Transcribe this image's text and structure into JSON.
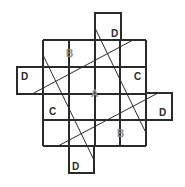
{
  "diagram": {
    "stroke_color": "#2a2a2a",
    "label_colors": {
      "dark": "#2a2a2a",
      "light": "#8a8a8a"
    },
    "grid": {
      "x_lines": [
        43,
        69,
        95,
        120,
        146
      ],
      "y_lines": [
        40,
        67,
        94,
        120,
        146
      ]
    },
    "extensions": [
      {
        "name": "top",
        "x": 95,
        "y": 13,
        "w": 26,
        "h": 27
      },
      {
        "name": "left",
        "x": 17,
        "y": 67,
        "w": 26,
        "h": 27
      },
      {
        "name": "right",
        "x": 146,
        "y": 93,
        "w": 26,
        "h": 27
      },
      {
        "name": "bottom",
        "x": 69,
        "y": 146,
        "w": 25,
        "h": 27
      }
    ],
    "diagonals": [
      {
        "name": "upper-shallow",
        "x1": 32,
        "y1": 94,
        "x2": 133,
        "y2": 40
      },
      {
        "name": "lower-shallow",
        "x1": 58,
        "y1": 146,
        "x2": 158,
        "y2": 93
      },
      {
        "name": "left-steep",
        "x1": 43,
        "y1": 55,
        "x2": 94,
        "y2": 160
      },
      {
        "name": "right-steep",
        "x1": 95,
        "y1": 28,
        "x2": 145,
        "y2": 131
      }
    ],
    "labels": [
      {
        "text": "D",
        "x": 111,
        "y": 37,
        "tone": "dark"
      },
      {
        "text": "B",
        "x": 66,
        "y": 57,
        "tone": "light"
      },
      {
        "text": "D",
        "x": 21,
        "y": 80,
        "tone": "dark"
      },
      {
        "text": "C",
        "x": 134,
        "y": 80,
        "tone": "dark"
      },
      {
        "text": "A",
        "x": 91,
        "y": 97,
        "tone": "light"
      },
      {
        "text": "C",
        "x": 49,
        "y": 115,
        "tone": "dark"
      },
      {
        "text": "D",
        "x": 159,
        "y": 116,
        "tone": "dark"
      },
      {
        "text": "B",
        "x": 117,
        "y": 137,
        "tone": "light"
      },
      {
        "text": "D",
        "x": 72,
        "y": 170,
        "tone": "dark"
      }
    ]
  }
}
